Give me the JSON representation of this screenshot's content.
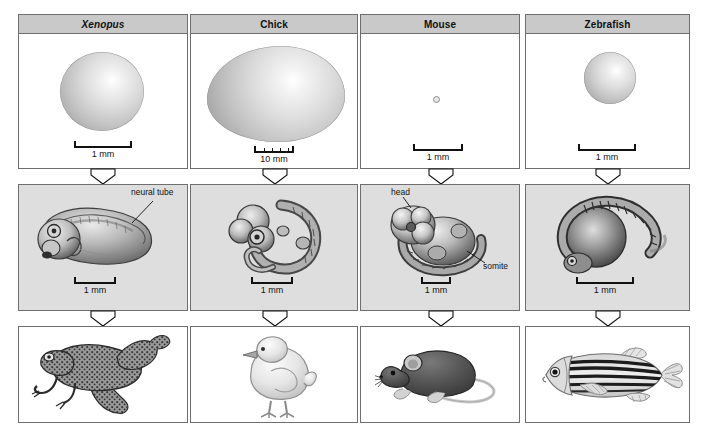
{
  "figure": {
    "rows": [
      "egg",
      "embryo",
      "adult"
    ],
    "colors": {
      "header_fill": "#c9c9c9",
      "panel_border": "#6e6e6e",
      "embryo_panel_fill": "#dedede",
      "arrow_fill": "#ffffff",
      "arrow_stroke": "#111111",
      "text": "#111111"
    }
  },
  "columns": [
    {
      "id": "xenopus",
      "header": "Xenopus",
      "header_italic": true,
      "egg": {
        "scale_label": "1 mm",
        "graduated": false
      },
      "embryo": {
        "scale_label": "1 mm",
        "graduated": false,
        "annotations": [
          {
            "text": "neural tube"
          }
        ]
      },
      "adult": {
        "name": "frog"
      }
    },
    {
      "id": "chick",
      "header": "Chick",
      "header_italic": false,
      "egg": {
        "scale_label": "10 mm",
        "graduated": true
      },
      "embryo": {
        "scale_label": "1 mm",
        "graduated": false,
        "annotations": []
      },
      "adult": {
        "name": "chick"
      }
    },
    {
      "id": "mouse",
      "header": "Mouse",
      "header_italic": false,
      "egg": {
        "scale_label": "1 mm",
        "graduated": false
      },
      "embryo": {
        "scale_label": "1 mm",
        "graduated": false,
        "annotations": [
          {
            "text": "head"
          },
          {
            "text": "somite"
          }
        ]
      },
      "adult": {
        "name": "mouse"
      }
    },
    {
      "id": "zebrafish",
      "header": "Zebrafish",
      "header_italic": false,
      "egg": {
        "scale_label": "1 mm",
        "graduated": false
      },
      "embryo": {
        "scale_label": "1 mm",
        "graduated": false,
        "annotations": []
      },
      "adult": {
        "name": "zebrafish"
      }
    }
  ]
}
